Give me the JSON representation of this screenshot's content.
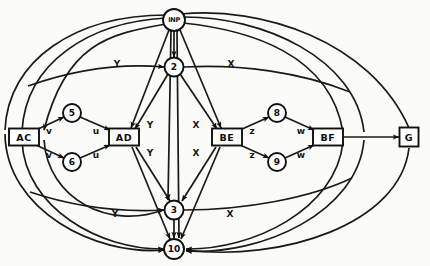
{
  "diagram": {
    "background_color": "#fbfbf8",
    "ink_color": "#101010",
    "nodes": [
      {
        "id": "inp",
        "label": "INP",
        "shape": "circle",
        "x": 174,
        "y": 20,
        "r": 11
      },
      {
        "id": "n2",
        "label": "2",
        "shape": "circle",
        "x": 174,
        "y": 67,
        "r": 9.5
      },
      {
        "id": "n5",
        "label": "5",
        "shape": "circle",
        "x": 72,
        "y": 113,
        "r": 9
      },
      {
        "id": "n6",
        "label": "6",
        "shape": "circle",
        "x": 72,
        "y": 162,
        "r": 9
      },
      {
        "id": "n8",
        "label": "8",
        "shape": "circle",
        "x": 277,
        "y": 113,
        "r": 9
      },
      {
        "id": "n9",
        "label": "9",
        "shape": "circle",
        "x": 277,
        "y": 162,
        "r": 9
      },
      {
        "id": "n3",
        "label": "3",
        "shape": "circle",
        "x": 174,
        "y": 210,
        "r": 9.5
      },
      {
        "id": "n10",
        "label": "10",
        "shape": "circle",
        "x": 174,
        "y": 249,
        "r": 10
      },
      {
        "id": "ac",
        "label": "AC",
        "shape": "box",
        "x": 24,
        "y": 137,
        "w": 30,
        "h": 17
      },
      {
        "id": "ad",
        "label": "AD",
        "shape": "box",
        "x": 124,
        "y": 137,
        "w": 30,
        "h": 17
      },
      {
        "id": "be",
        "label": "BE",
        "shape": "box",
        "x": 227,
        "y": 137,
        "w": 30,
        "h": 17
      },
      {
        "id": "bf",
        "label": "BF",
        "shape": "box",
        "x": 328,
        "y": 137,
        "w": 30,
        "h": 17
      },
      {
        "id": "g",
        "label": "G",
        "shape": "box",
        "x": 409,
        "y": 137,
        "w": 19,
        "h": 19
      }
    ],
    "edge_labels": [
      {
        "id": "lbl-v-top",
        "text": "v",
        "x": 49,
        "y": 131
      },
      {
        "id": "lbl-u-top",
        "text": "u",
        "x": 96,
        "y": 131
      },
      {
        "id": "lbl-v-bot",
        "text": "v",
        "x": 49,
        "y": 155
      },
      {
        "id": "lbl-u-bot",
        "text": "u",
        "x": 96,
        "y": 155
      },
      {
        "id": "lbl-z-top",
        "text": "z",
        "x": 252,
        "y": 131
      },
      {
        "id": "lbl-w-top",
        "text": "w",
        "x": 301,
        "y": 131
      },
      {
        "id": "lbl-z-bot",
        "text": "z",
        "x": 252,
        "y": 155
      },
      {
        "id": "lbl-w-bot",
        "text": "w",
        "x": 301,
        "y": 155
      },
      {
        "id": "lbl-y-mid-top",
        "text": "Y",
        "x": 150,
        "y": 125
      },
      {
        "id": "lbl-y-mid-bot",
        "text": "Y",
        "x": 150,
        "y": 153
      },
      {
        "id": "lbl-x-mid-top",
        "text": "X",
        "x": 196,
        "y": 125
      },
      {
        "id": "lbl-x-mid-bot",
        "text": "X",
        "x": 196,
        "y": 153
      },
      {
        "id": "lbl-y-upper",
        "text": "Y",
        "x": 117,
        "y": 64
      },
      {
        "id": "lbl-x-upper",
        "text": "X",
        "x": 231,
        "y": 64
      },
      {
        "id": "lbl-y-lower",
        "text": "Y",
        "x": 115,
        "y": 214
      },
      {
        "id": "lbl-x-lower",
        "text": "X",
        "x": 230,
        "y": 214
      }
    ]
  }
}
